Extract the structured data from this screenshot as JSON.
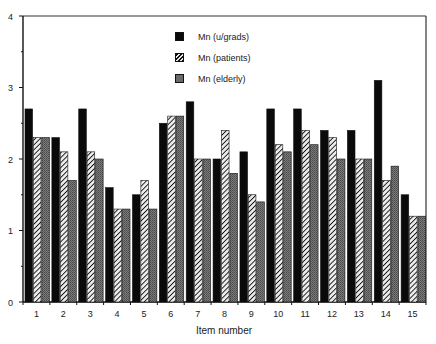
{
  "chart_data": {
    "type": "bar",
    "title": "",
    "xlabel": "Item number",
    "ylabel": "",
    "ylim": [
      0,
      4
    ],
    "yticks": [
      0,
      1,
      2,
      3,
      4
    ],
    "grid": false,
    "legend_position": "top-center (inside plot)",
    "categories": [
      "1",
      "2",
      "3",
      "4",
      "5",
      "6",
      "7",
      "8",
      "9",
      "10",
      "11",
      "12",
      "13",
      "14",
      "15"
    ],
    "series": [
      {
        "name": "Mn (u/grads)",
        "style": "solid-black",
        "color": "#0a0a0a",
        "values": [
          2.7,
          2.3,
          2.7,
          1.6,
          1.5,
          2.5,
          2.8,
          2.0,
          2.1,
          2.7,
          2.7,
          2.4,
          2.4,
          3.1,
          1.5
        ]
      },
      {
        "name": "Mn (patients)",
        "style": "hatched",
        "color": "#9a9a9a",
        "values": [
          2.3,
          2.1,
          2.1,
          1.3,
          1.7,
          2.6,
          2.0,
          2.4,
          1.5,
          2.2,
          2.4,
          2.3,
          2.0,
          1.7,
          1.2
        ]
      },
      {
        "name": "Mn (elderly)",
        "style": "gray-stipple",
        "color": "#6a6a6a",
        "values": [
          2.3,
          1.7,
          2.0,
          1.3,
          1.3,
          2.6,
          2.0,
          1.8,
          1.4,
          2.1,
          2.2,
          2.0,
          2.0,
          1.9,
          1.2
        ]
      }
    ]
  },
  "legend": {
    "items": [
      {
        "label": "Mn (u/grads)"
      },
      {
        "label": "Mn (patients)"
      },
      {
        "label": "Mn (elderly)"
      }
    ]
  },
  "axes": {
    "xlabel": "Item number",
    "ytick_labels": [
      "0",
      "1",
      "2",
      "3",
      "4"
    ]
  }
}
